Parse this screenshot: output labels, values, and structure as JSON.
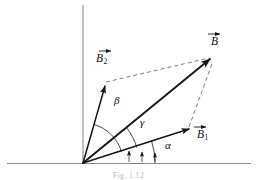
{
  "figure": {
    "caption": "Fig. 1.12",
    "width": 257,
    "height": 180,
    "background_color": "#ffffff"
  },
  "colors": {
    "axis": "#8a8a8a",
    "vector": "#141414",
    "dashed": "#7e7e7e",
    "arc": "#262626",
    "label": "#0d0d0d",
    "caption": "#b9b9b9"
  },
  "axes": {
    "vertical_label": "",
    "horizontal_label": "",
    "origin": {
      "x": 83,
      "y": 163
    }
  },
  "labels": {
    "resultant": {
      "base": "B",
      "sub": "",
      "x": 211,
      "y": 41
    },
    "component_y": {
      "base": "B",
      "sub": "2",
      "x": 93,
      "y": 58
    },
    "component_x": {
      "base": "B",
      "sub": "1",
      "x": 196,
      "y": 134
    },
    "angle_beta": {
      "text": "β",
      "x": 115,
      "y": 100
    },
    "angle_gamma": {
      "text": "γ",
      "x": 141,
      "y": 122
    },
    "angle_alpha": {
      "text": "α",
      "x": 166,
      "y": 144
    }
  },
  "vectors": [
    {
      "name": "B2",
      "label": "B₂",
      "from": {
        "x": 83,
        "y": 163
      },
      "to": {
        "x": 105,
        "y": 83
      },
      "style": "solid"
    },
    {
      "name": "B1",
      "label": "B₁",
      "from": {
        "x": 83,
        "y": 163
      },
      "to": {
        "x": 190,
        "y": 128
      },
      "style": "solid"
    },
    {
      "name": "B",
      "label": "B",
      "from": {
        "x": 83,
        "y": 163
      },
      "to": {
        "x": 212,
        "y": 57
      },
      "style": "solid-bold"
    }
  ],
  "construction_lines": [
    {
      "name": "b2-to-b",
      "from": {
        "x": 105,
        "y": 83
      },
      "to": {
        "x": 209,
        "y": 58
      },
      "style": "dashed"
    },
    {
      "name": "b1-to-b",
      "from": {
        "x": 190,
        "y": 128
      },
      "to": {
        "x": 213,
        "y": 60
      },
      "style": "dashed"
    }
  ],
  "angles": [
    {
      "name": "beta",
      "symbol": "β",
      "radius": 40,
      "from_deg": 16,
      "to_deg": 74
    },
    {
      "name": "gamma",
      "symbol": "γ",
      "radius": 56,
      "from_deg": 16,
      "to_deg": 39
    },
    {
      "name": "alpha",
      "symbol": "α",
      "radius": 72,
      "from_deg": 0,
      "to_deg": 18
    }
  ]
}
